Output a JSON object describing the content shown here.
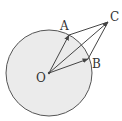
{
  "diagram": {
    "title": "",
    "colors": {
      "circle_fill": "#ebebeb",
      "circle_stroke": "#555555",
      "line": "#444444",
      "label": "#333333"
    },
    "circle": {
      "center": "O",
      "cx": 49,
      "cy": 73,
      "r": 43
    },
    "points": {
      "O": {
        "label": "O",
        "x": 49,
        "y": 73
      },
      "A": {
        "label": "A",
        "x": 69,
        "y": 35
      },
      "B": {
        "label": "B",
        "x": 88,
        "y": 59
      },
      "C": {
        "label": "C",
        "x": 108,
        "y": 22
      }
    },
    "vectors": [
      {
        "from": "O",
        "to": "A"
      },
      {
        "from": "O",
        "to": "B"
      },
      {
        "from": "O",
        "to": "C"
      }
    ],
    "segments": [
      {
        "from": "A",
        "to": "C"
      },
      {
        "from": "B",
        "to": "C"
      }
    ]
  }
}
